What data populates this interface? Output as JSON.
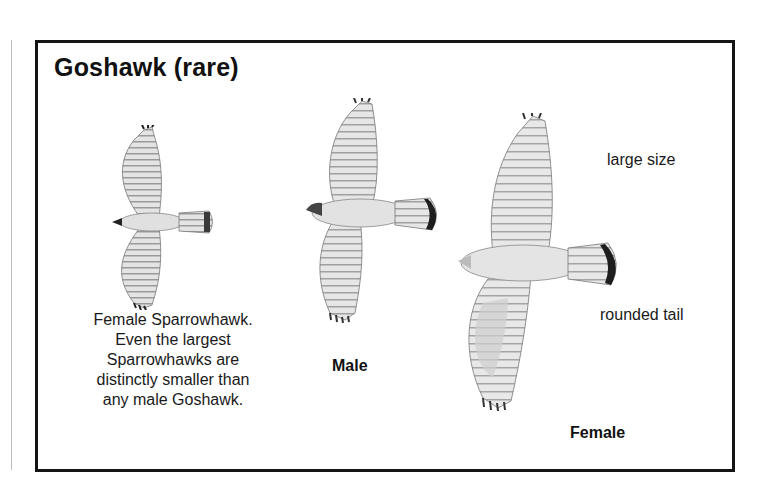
{
  "panel": {
    "title": "Goshawk (rare)",
    "birds": [
      {
        "id": "female-sparrowhawk",
        "caption_lines": [
          "Female Sparrowhawk.",
          "Even the largest",
          "Sparrowhawks are",
          "distinctly smaller than",
          "any male Goshawk."
        ]
      },
      {
        "id": "male-goshawk",
        "label": "Male"
      },
      {
        "id": "female-goshawk",
        "label": "Female"
      }
    ],
    "annotations": {
      "size": "large size",
      "tail": "rounded tail"
    }
  },
  "colors": {
    "border": "#141414",
    "wing": "#d9d9d9",
    "barring": "#8a8a8a",
    "tips": "#2a2a2a"
  }
}
